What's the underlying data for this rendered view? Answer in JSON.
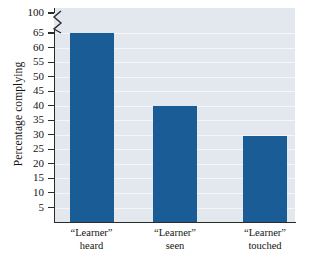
{
  "chart_data": {
    "type": "bar",
    "title": "",
    "xlabel": "",
    "ylabel": "Percentage complying",
    "categories": [
      "“Learner” heard",
      "“Learner” seen",
      "“Learner” touched"
    ],
    "category_lines": [
      {
        "line1": "“Learner”",
        "line2": "heard"
      },
      {
        "line1": "“Learner”",
        "line2": "seen"
      },
      {
        "line1": "“Learner”",
        "line2": "touched"
      }
    ],
    "values": [
      65,
      40,
      29.5
    ],
    "ylim": [
      0,
      100
    ],
    "y_ticks": [
      5,
      10,
      15,
      20,
      25,
      30,
      35,
      40,
      45,
      50,
      55,
      60,
      65,
      100
    ],
    "y_tick_labels": [
      "5",
      "10",
      "15",
      "20",
      "25",
      "30",
      "35",
      "40",
      "45",
      "50",
      "55",
      "60",
      "65",
      "100"
    ],
    "axis_break": {
      "present": true,
      "between": [
        65,
        100
      ],
      "symbol": "zigzag"
    },
    "grid": true,
    "legend": false,
    "colors": {
      "bar": "#1a5c96",
      "plot_background": "#e3e7ee",
      "gridline": "#f4f6fa",
      "axis": "#2b2b2b",
      "text": "#141414",
      "page_background": "#ffffff"
    }
  },
  "axis": {
    "y_title": "Percentage complying"
  }
}
